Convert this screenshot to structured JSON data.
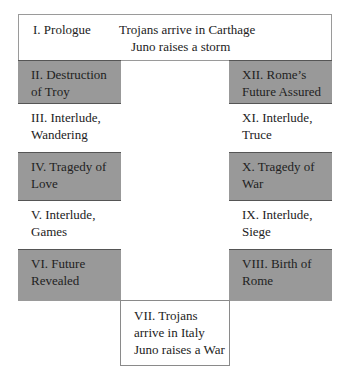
{
  "prologue": {
    "label": "I. Prologue",
    "line1": "Trojans arrive in Carthage",
    "line2": "Juno raises a storm"
  },
  "left_column": [
    {
      "text": "II. Destruction of Troy",
      "l1": "II. Destruction",
      "l2": "of Troy",
      "shade": "gray"
    },
    {
      "text": "III. Interlude, Wandering",
      "l1": "III. Interlude,",
      "l2": "Wandering",
      "shade": "white"
    },
    {
      "text": "IV. Tragedy of Love",
      "l1": "IV. Tragedy of",
      "l2": "Love",
      "shade": "gray"
    },
    {
      "text": "V. Interlude, Games",
      "l1": "V. Interlude,",
      "l2": "Games",
      "shade": "white"
    },
    {
      "text": "VI. Future Revealed",
      "l1": "VI. Future",
      "l2": "Revealed",
      "shade": "gray"
    }
  ],
  "right_column": [
    {
      "text": "XII. Rome's Future Assured",
      "l1": "XII. Rome’s",
      "l2": "Future Assured",
      "shade": "gray"
    },
    {
      "text": "XI. Interlude, Truce",
      "l1": "XI. Interlude,",
      "l2": "Truce",
      "shade": "white"
    },
    {
      "text": "X. Tragedy of War",
      "l1": "X. Tragedy of",
      "l2": "War",
      "shade": "gray"
    },
    {
      "text": "IX. Interlude, Siege",
      "l1": "IX. Interlude,",
      "l2": "Siege",
      "shade": "white"
    },
    {
      "text": "VIII. Birth of Rome",
      "l1": "VIII. Birth of",
      "l2": "Rome",
      "shade": "gray"
    }
  ],
  "bottom": {
    "line1": "VII. Trojans",
    "line2": "arrive in Italy",
    "line3": "Juno raises a War"
  },
  "colors": {
    "gray": "#999999",
    "white": "#ffffff",
    "border": "#555555"
  }
}
